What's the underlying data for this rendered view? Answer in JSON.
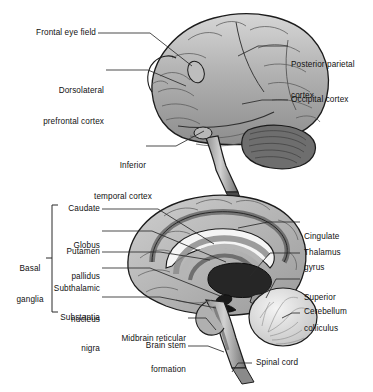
{
  "figure": {
    "type": "anatomical-diagram",
    "panels": 2
  },
  "colors": {
    "cortex_light": "#c9c9c9",
    "cortex_mid": "#a8a8a8",
    "cortex_dark": "#8a8a8a",
    "outline": "#1c1c1c",
    "sulcus": "#5a5a5a",
    "deep_nucleus": "#2a2a2a",
    "white_matter": "#f2f2f2",
    "leader_line": "#2b2b2b",
    "text": "#111111",
    "background": "#ffffff"
  },
  "panel_top": {
    "name": "lateral-view",
    "labels": [
      {
        "id": "frontal-eye-field",
        "text": "Frontal eye field",
        "align": "right",
        "x": 95,
        "y": 31
      },
      {
        "id": "dorsolateral-prefrontal-cortex",
        "line1": "Dorsolateral",
        "line2": "prefrontal cortex",
        "align": "right",
        "x": 103,
        "y": 68
      },
      {
        "id": "posterior-parietal-cortex",
        "line1": "Posterior parietal",
        "line2": "cortex",
        "align": "left",
        "x": 291,
        "y": 42
      },
      {
        "id": "occipital-cortex",
        "text": "Occipital cortex",
        "align": "left",
        "x": 291,
        "y": 96
      },
      {
        "id": "inferior-temporal-cortex",
        "line1": "Inferior",
        "line2": "temporal cortex",
        "align": "center",
        "x": 104,
        "y": 143
      }
    ]
  },
  "panel_bottom": {
    "name": "midsagittal-view",
    "bracket_label": {
      "id": "basal-ganglia",
      "line1": "Basal",
      "line2": "ganglia",
      "x": 14,
      "y": 245
    },
    "labels_left": [
      {
        "id": "caudate",
        "text": "Caudate",
        "x": 46,
        "y": 206
      },
      {
        "id": "globus-pallidus",
        "line1": "Globus",
        "line2": "pallidus",
        "x": 46,
        "y": 222
      },
      {
        "id": "putamen",
        "text": "Putamen",
        "x": 46,
        "y": 249
      },
      {
        "id": "subthalamic-nucleus",
        "line1": "Subthalamic",
        "line2": "nucleus",
        "x": 46,
        "y": 265
      },
      {
        "id": "substantia-nigra",
        "line1": "Substantia",
        "line2": "nigra",
        "x": 46,
        "y": 294
      }
    ],
    "labels_right": [
      {
        "id": "cingulate-gyrus",
        "line1": "Cingulate",
        "line2": "gyrus",
        "x": 304,
        "y": 214
      },
      {
        "id": "thalamus",
        "text": "Thalamus",
        "x": 304,
        "y": 250
      },
      {
        "id": "superior-colliculus",
        "line1": "Superior",
        "line2": "colliculus",
        "x": 304,
        "y": 274
      },
      {
        "id": "cerebellum",
        "text": "Cerebellum",
        "x": 304,
        "y": 308
      }
    ],
    "labels_bottom": [
      {
        "id": "midbrain-reticular-formation",
        "line1": "Midbrain reticular",
        "line2": "formation",
        "align": "right",
        "x": 110,
        "y": 315
      },
      {
        "id": "brain-stem",
        "text": "Brain stem",
        "align": "right",
        "x": 110,
        "y": 343
      },
      {
        "id": "spinal-cord",
        "text": "Spinal cord",
        "align": "left",
        "x": 256,
        "y": 359
      }
    ]
  }
}
